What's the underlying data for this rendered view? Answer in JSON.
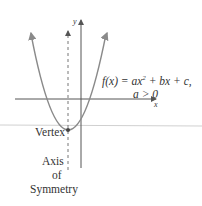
{
  "diagram": {
    "equation": {
      "prefix": "f(x) = ax",
      "exponent": "2",
      "suffix": " + bx + c,",
      "condition": "a > 0"
    },
    "axes": {
      "x_label": "x",
      "y_label": "y"
    },
    "labels": {
      "vertex": "Vertex",
      "axis_line1": "Axis",
      "axis_line2": "of",
      "axis_line3": "Symmetry"
    },
    "colors": {
      "curve": "#8a8a8a",
      "axes": "#555555",
      "text": "#333333",
      "divider": "#cfcfcf"
    }
  }
}
